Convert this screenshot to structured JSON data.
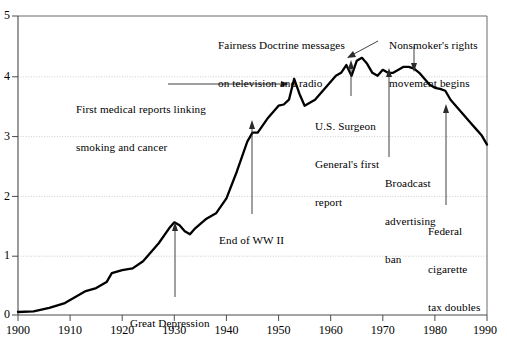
{
  "chart_data": {
    "type": "line",
    "title": "",
    "subtitle": "",
    "xlabel": "",
    "ylabel": "",
    "xlim": [
      1900,
      1990
    ],
    "ylim": [
      0,
      5
    ],
    "grid": true,
    "gridlines_y": [
      1,
      2,
      3,
      4
    ],
    "legend": "none",
    "x_ticks": [
      "1900",
      "1910",
      "1920",
      "1930",
      "1940",
      "1950",
      "1960",
      "1970",
      "1980",
      "1990"
    ],
    "y_ticks": [
      "0",
      "1",
      "2",
      "3",
      "4",
      "5"
    ],
    "series": [
      {
        "name": "Annual adult per capita cigarette consumption (thousands)",
        "x": [
          1900,
          1903,
          1906,
          1909,
          1911,
          1913,
          1915,
          1917,
          1918,
          1920,
          1922,
          1924,
          1925,
          1927,
          1929,
          1930,
          1931,
          1932,
          1933,
          1934,
          1936,
          1938,
          1940,
          1942,
          1944,
          1945,
          1946,
          1948,
          1950,
          1951,
          1952,
          1953,
          1954,
          1955,
          1957,
          1959,
          1961,
          1962,
          1963,
          1964,
          1965,
          1966,
          1967,
          1968,
          1969,
          1970,
          1971,
          1972,
          1973,
          1974,
          1975,
          1976,
          1977,
          1978,
          1979,
          1980,
          1981,
          1982,
          1983,
          1984,
          1985,
          1986,
          1987,
          1988,
          1989,
          1990
        ],
        "values": [
          0.05,
          0.06,
          0.12,
          0.2,
          0.3,
          0.4,
          0.45,
          0.55,
          0.7,
          0.75,
          0.78,
          0.9,
          1.0,
          1.2,
          1.45,
          1.55,
          1.5,
          1.4,
          1.35,
          1.45,
          1.6,
          1.7,
          1.95,
          2.4,
          2.9,
          3.05,
          3.05,
          3.3,
          3.5,
          3.52,
          3.6,
          3.95,
          3.7,
          3.5,
          3.6,
          3.8,
          4.0,
          4.05,
          4.18,
          4.0,
          4.25,
          4.3,
          4.2,
          4.05,
          4.0,
          4.1,
          4.05,
          4.05,
          4.1,
          4.15,
          4.15,
          4.12,
          4.05,
          3.95,
          3.85,
          3.8,
          3.78,
          3.75,
          3.6,
          3.5,
          3.4,
          3.3,
          3.2,
          3.1,
          3.0,
          2.85
        ]
      }
    ],
    "annotations": [
      {
        "id": "first-medical-reports",
        "text": "First medical reports linking\nsmoking and cancer",
        "target_x": 1953,
        "target_y": 3.9
      },
      {
        "id": "fairness-doctrine",
        "text": "Fairness Doctrine messages\non television and radio",
        "target_x": 1967,
        "target_y": 4.25
      },
      {
        "id": "nonsmokers-rights",
        "text": "Nonsmoker's rights\nmovement begins",
        "target_x": 1976,
        "target_y": 4.17
      },
      {
        "id": "great-depression",
        "text": "Great Depression",
        "target_x": 1930,
        "target_y": 1.55
      },
      {
        "id": "end-of-ww2",
        "text": "End of WW II",
        "target_x": 1945,
        "target_y": 3.05
      },
      {
        "id": "surgeon-general",
        "text": "U.S. Surgeon\nGeneral's first\nreport",
        "target_x": 1964,
        "target_y": 4.0
      },
      {
        "id": "broadcast-ad-ban",
        "text": "Broadcast\nadvertising\nban",
        "target_x": 1971,
        "target_y": 4.05
      },
      {
        "id": "federal-tax-doubles",
        "text": "Federal\ncigarette\ntax doubles",
        "target_x": 1983,
        "target_y": 3.6
      }
    ]
  },
  "axes": {
    "y_labels": [
      "5",
      "4",
      "3",
      "2",
      "1",
      "0"
    ],
    "x_labels": [
      "1900",
      "1910",
      "1920",
      "1930",
      "1940",
      "1950",
      "1960",
      "1970",
      "1980",
      "1990"
    ]
  },
  "annotations": {
    "first_medical_reports": {
      "line1": "First medical reports linking",
      "line2": "smoking and cancer"
    },
    "fairness_doctrine": {
      "line1": "Fairness Doctrine messages",
      "line2": "on television and radio"
    },
    "nonsmokers_rights": {
      "line1": "Nonsmoker's rights",
      "line2": "movement begins"
    },
    "great_depression": {
      "line1": "Great Depression"
    },
    "end_of_ww2": {
      "line1": "End of WW II"
    },
    "surgeon_general": {
      "line1": "U.S. Surgeon",
      "line2": "General's first",
      "line3": "report"
    },
    "broadcast_ad_ban": {
      "line1": "Broadcast",
      "line2": "advertising",
      "line3": "ban"
    },
    "federal_tax_doubles": {
      "line1": "Federal",
      "line2": "cigarette",
      "line3": "tax doubles"
    }
  },
  "colors": {
    "line": "#000000",
    "frame": "#555555",
    "grid": "#b9b9b9",
    "text": "#000000",
    "background": "#ffffff"
  }
}
